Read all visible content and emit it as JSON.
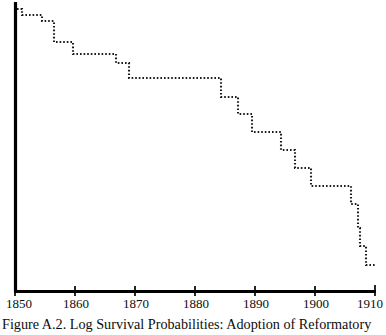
{
  "figure": {
    "caption": "Figure A.2.  Log Survival Probabilities: Adoption of Reformatory",
    "background_color": "#ffffff",
    "axis_color": "#000000",
    "curve_color": "#1a1a1a"
  },
  "axes": {
    "x_tick_labels": [
      "1850",
      "1860",
      "1870",
      "1880",
      "1890",
      "1900",
      "1910"
    ],
    "x_tick_values": [
      1850,
      1860,
      1870,
      1880,
      1890,
      1900,
      1910
    ],
    "x_axis_label": "",
    "y_axis_label": "",
    "y_tick_labels": [],
    "grid": "off"
  },
  "chart_data": {
    "type": "line",
    "title": "Figure A.2.  Log Survival Probabilities: Adoption of Reformatory",
    "xlabel": "",
    "ylabel": "Log Survival Probability",
    "xlim": [
      1850,
      1910
    ],
    "ylim": [
      -1.0,
      0.0
    ],
    "grid": false,
    "legend": "none",
    "style": "step-post dotted",
    "series": [
      {
        "name": "Log survival probability",
        "x": [
          1850.0,
          1850.8,
          1850.8,
          1854.2,
          1854.2,
          1856.2,
          1856.2,
          1862.8,
          1862.8,
          1866.0,
          1866.0,
          1873.2,
          1873.2,
          1874.8,
          1874.8,
          1890.2,
          1890.2,
          1893.0,
          1893.0,
          1895.0,
          1895.0,
          1898.0,
          1898.0,
          1900.5,
          1900.5,
          1902.0,
          1902.0,
          1904.8,
          1904.8,
          1906.2,
          1906.2,
          1908.0,
          1908.0,
          1910.0
        ],
        "y": [
          -0.031,
          -0.031,
          -0.052,
          -0.052,
          -0.072,
          -0.072,
          -0.145,
          -0.145,
          -0.193,
          -0.193,
          -0.269,
          -0.269,
          -0.307,
          -0.307,
          -0.383,
          -0.383,
          -0.448,
          -0.448,
          -0.507,
          -0.507,
          -0.573,
          -0.573,
          -0.648,
          -0.648,
          -0.724,
          -0.724,
          -0.793,
          -0.793,
          -0.869,
          -0.869,
          -0.938,
          -0.938,
          -1.0,
          -1.0
        ]
      }
    ]
  },
  "steps": {
    "description": "Step (survival) curve drawn as a dotted staircase descending from upper-left to lower-right.",
    "points_px": [
      [
        17,
        9
      ],
      [
        22,
        9
      ],
      [
        22,
        15
      ],
      [
        42,
        15
      ],
      [
        42,
        21
      ],
      [
        54,
        21
      ],
      [
        54,
        42
      ],
      [
        73,
        42
      ],
      [
        73,
        54
      ],
      [
        116,
        54
      ],
      [
        116,
        63
      ],
      [
        129,
        63
      ],
      [
        129,
        78
      ],
      [
        221,
        78
      ],
      [
        221,
        97
      ],
      [
        238,
        97
      ],
      [
        238,
        114
      ],
      [
        252,
        114
      ],
      [
        252,
        132
      ],
      [
        281,
        132
      ],
      [
        281,
        150
      ],
      [
        295,
        150
      ],
      [
        295,
        168
      ],
      [
        311,
        168
      ],
      [
        311,
        186
      ],
      [
        351,
        186
      ],
      [
        351,
        204
      ],
      [
        358,
        204
      ],
      [
        358,
        228
      ],
      [
        360,
        228
      ],
      [
        360,
        246
      ],
      [
        366,
        246
      ],
      [
        366,
        265
      ],
      [
        376,
        265
      ]
    ]
  }
}
